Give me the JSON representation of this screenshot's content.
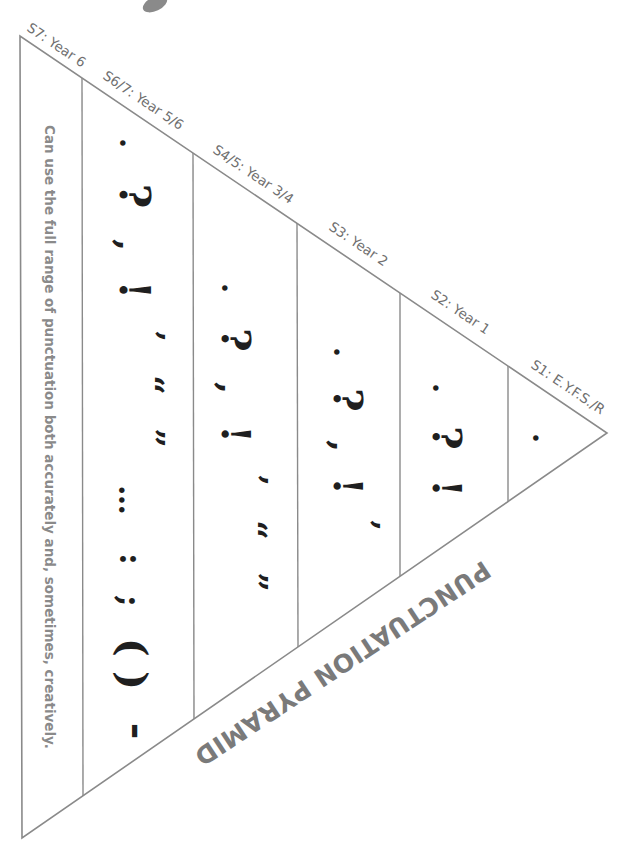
{
  "title": "PUNCTUATION PYRAMID",
  "colors": {
    "outline": "#8a8a8a",
    "label_text": "#6f6f6f",
    "glyph": "#1f1f1f",
    "title_text": "#7a7a7a"
  },
  "stages": [
    {
      "id": "s7",
      "label": "S7: Year 6",
      "content": "Can use the full range of punctuation both accurately and, sometimes, creatively."
    },
    {
      "id": "s6-7",
      "label": "S6/7: Year 5/6",
      "glyphs": [
        ".",
        "?",
        ",",
        "!",
        "’",
        "“",
        "”",
        "…",
        ":",
        ";",
        "( )",
        "-"
      ]
    },
    {
      "id": "s4-5",
      "label": "S4/5: Year 3/4",
      "glyphs": [
        ".",
        "?",
        ",",
        "!",
        "’",
        "“",
        "”"
      ]
    },
    {
      "id": "s3",
      "label": "S3: Year 2",
      "glyphs": [
        ".",
        "?",
        ",",
        "!",
        "’"
      ]
    },
    {
      "id": "s2",
      "label": "S2: Year 1",
      "glyphs": [
        ".",
        "?",
        "!"
      ]
    },
    {
      "id": "s1",
      "label": "S1: E.Y.F.S./R",
      "glyphs": [
        "."
      ]
    }
  ]
}
